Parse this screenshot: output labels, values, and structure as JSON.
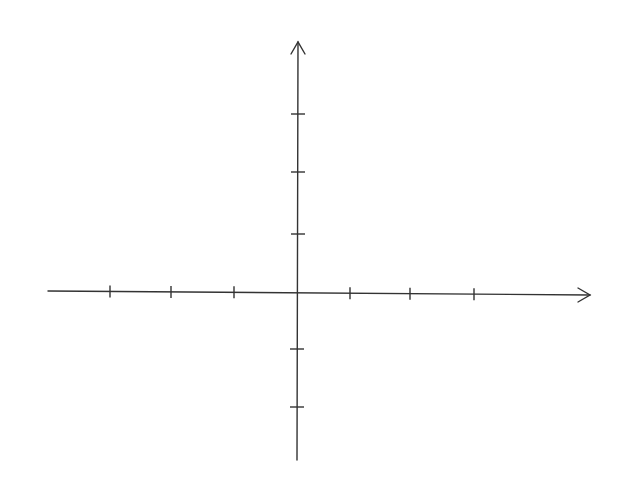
{
  "diagram": {
    "type": "coordinate-axes",
    "x_axis": {
      "arrow": "positive-direction",
      "ticks_negative": 3,
      "ticks_positive": 3,
      "labels": []
    },
    "y_axis": {
      "arrow": "positive-direction",
      "ticks_positive": 3,
      "ticks_negative": 2,
      "labels": []
    },
    "colors": {
      "stroke": "#333333",
      "background": "#ffffff"
    }
  }
}
